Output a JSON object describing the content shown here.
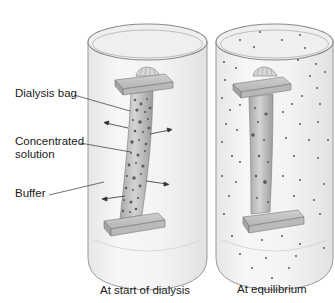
{
  "diagram": {
    "title": "Dialysis",
    "panels": [
      {
        "id": "start",
        "caption": "At start of dialysis",
        "state": "concentrated solution inside bag, buffer outside; arrows show diffusion outward"
      },
      {
        "id": "equilibrium",
        "caption": "At equilibrium",
        "state": "small molecules evenly distributed inside and outside bag"
      }
    ],
    "labels": {
      "dialysis_bag": "Dialysis bag",
      "concentrated_line1": "Concentrated",
      "concentrated_line2": "solution",
      "buffer": "Buffer"
    },
    "colors": {
      "cylinder_outline": "#9a9a9a",
      "cylinder_fill": "#f2f2f2",
      "bag_fill": "#c9c9c9",
      "bag_shadow": "#9d9d9d",
      "clamp_fill": "#bdbdbd",
      "dot": "#5a5a5a",
      "leader_line": "#333333"
    }
  }
}
